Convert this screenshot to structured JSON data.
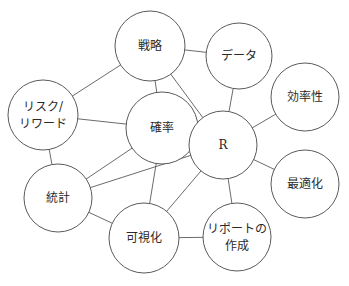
{
  "diagram": {
    "type": "network",
    "header_fragment": "",
    "nodes": [
      {
        "id": "senryaku",
        "label": [
          "戦略"
        ],
        "cx": 150,
        "cy": 46,
        "r": 35
      },
      {
        "id": "data",
        "label": [
          "データ"
        ],
        "cx": 239,
        "cy": 56,
        "r": 33
      },
      {
        "id": "risk",
        "label": [
          "リスク/",
          "リワード"
        ],
        "cx": 43,
        "cy": 115,
        "r": 35
      },
      {
        "id": "kakuritsu",
        "label": [
          "確率"
        ],
        "cx": 162,
        "cy": 128,
        "r": 36
      },
      {
        "id": "r",
        "label": [
          "R"
        ],
        "cx": 223,
        "cy": 145,
        "r": 34
      },
      {
        "id": "kouritsusei",
        "label": [
          "効率性"
        ],
        "cx": 305,
        "cy": 97,
        "r": 34
      },
      {
        "id": "toukei",
        "label": [
          "統計"
        ],
        "cx": 58,
        "cy": 198,
        "r": 34
      },
      {
        "id": "saitekika",
        "label": [
          "最適化"
        ],
        "cx": 305,
        "cy": 184,
        "r": 34
      },
      {
        "id": "kashika",
        "label": [
          "可視化"
        ],
        "cx": 144,
        "cy": 238,
        "r": 35
      },
      {
        "id": "report",
        "label": [
          "リポートの",
          "作成"
        ],
        "cx": 237,
        "cy": 237,
        "r": 34
      }
    ],
    "edges": [
      [
        "senryaku",
        "data"
      ],
      [
        "senryaku",
        "risk"
      ],
      [
        "senryaku",
        "kakuritsu"
      ],
      [
        "senryaku",
        "r"
      ],
      [
        "data",
        "r"
      ],
      [
        "risk",
        "kakuritsu"
      ],
      [
        "risk",
        "toukei"
      ],
      [
        "kakuritsu",
        "r"
      ],
      [
        "kakuritsu",
        "toukei"
      ],
      [
        "kakuritsu",
        "kashika"
      ],
      [
        "r",
        "kouritsusei"
      ],
      [
        "r",
        "saitekika"
      ],
      [
        "r",
        "toukei"
      ],
      [
        "r",
        "kashika"
      ],
      [
        "r",
        "report"
      ],
      [
        "toukei",
        "kashika"
      ],
      [
        "kashika",
        "report"
      ]
    ]
  }
}
